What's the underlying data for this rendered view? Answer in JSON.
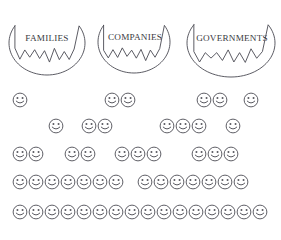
{
  "figure": {
    "title": "",
    "circles": [
      {
        "label": "FAMILIES",
        "name": "torn-circle-families",
        "x": 8,
        "y": 10,
        "w": 78,
        "h": 66,
        "label_x": 14,
        "label_y": 34,
        "label_w": 66,
        "font_size": 9.2
      },
      {
        "label": "COMPANIES",
        "name": "torn-circle-companies",
        "x": 97,
        "y": 10,
        "w": 74,
        "h": 64,
        "label_x": 100,
        "label_y": 33,
        "label_w": 70,
        "font_size": 9.2
      },
      {
        "label": "GOVERNMENTS",
        "name": "torn-circle-governments",
        "x": 186,
        "y": 8,
        "w": 90,
        "h": 70,
        "label_x": 187,
        "label_y": 34,
        "label_w": 90,
        "font_size": 9.2
      }
    ],
    "smiley_rows": [
      {
        "name": "smiley-row-1",
        "y": 4,
        "clusters": [
          {
            "x": 12,
            "count": 1
          },
          {
            "x": 104,
            "count": 2
          },
          {
            "x": 196,
            "count": 2
          },
          {
            "x": 243,
            "count": 1
          }
        ]
      },
      {
        "name": "smiley-row-2",
        "y": 30,
        "clusters": [
          {
            "x": 48,
            "count": 1
          },
          {
            "x": 81,
            "count": 2
          },
          {
            "x": 159,
            "count": 3
          },
          {
            "x": 225,
            "count": 1
          }
        ]
      },
      {
        "name": "smiley-row-3",
        "y": 58,
        "clusters": [
          {
            "x": 12,
            "count": 2
          },
          {
            "x": 64,
            "count": 2
          },
          {
            "x": 114,
            "count": 3
          },
          {
            "x": 191,
            "count": 3
          }
        ]
      },
      {
        "name": "smiley-row-4",
        "y": 86,
        "clusters": [
          {
            "x": 12,
            "count": 7
          },
          {
            "x": 137,
            "count": 7
          }
        ]
      },
      {
        "name": "smiley-row-5",
        "y": 116,
        "clusters": [
          {
            "x": 12,
            "count": 16
          }
        ]
      }
    ],
    "smiley": {
      "size": 16,
      "stroke_color": "#58585f",
      "fill_color": "#ffffff"
    },
    "colors": {
      "outline": "#4a4a52",
      "text": "#3a3a42",
      "background": "#ffffff"
    }
  }
}
